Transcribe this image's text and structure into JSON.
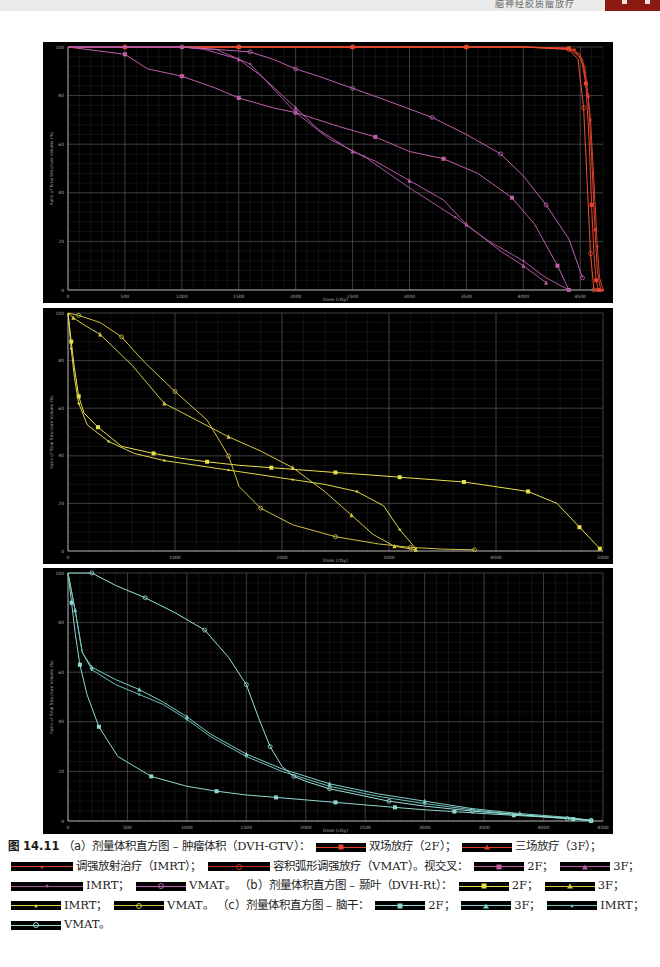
{
  "page": {
    "header_text": "脑神经胶质瘤放疗",
    "header_tab_color": "#8a1a12"
  },
  "chart_data": [
    {
      "id": "a",
      "type": "line",
      "title": "DVH-GTV",
      "xlabel": "Dose (cGy)",
      "ylabel": "Ratio of Total Structure Volume (%)",
      "xlim": [
        0,
        4700
      ],
      "ylim": [
        0,
        100
      ],
      "xticks": [
        0,
        500,
        1000,
        1500,
        2000,
        2500,
        3000,
        3500,
        4000,
        4500
      ],
      "yticks": [
        0,
        20,
        40,
        60,
        80,
        100
      ],
      "grid": true,
      "legend_position": "caption",
      "series": [
        {
          "name": "GTV 2F",
          "color": "#e8452a",
          "marker": "square",
          "x": [
            0,
            500,
            1000,
            1500,
            2000,
            2500,
            3000,
            3500,
            4000,
            4400,
            4500,
            4550,
            4580,
            4600,
            4620,
            4640,
            4660
          ],
          "y": [
            100,
            100,
            100,
            100,
            100,
            100,
            100,
            100,
            100,
            99.5,
            97,
            85,
            60,
            35,
            15,
            4,
            0
          ]
        },
        {
          "name": "GTV 3F",
          "color": "#e0402a",
          "marker": "triangle",
          "x": [
            0,
            500,
            1000,
            1500,
            2000,
            2500,
            3000,
            3500,
            4000,
            4400,
            4520,
            4570,
            4600,
            4630,
            4650,
            4680
          ],
          "y": [
            100,
            100,
            100,
            100,
            100,
            100,
            100,
            100,
            100,
            99.5,
            95,
            80,
            55,
            25,
            8,
            0
          ]
        },
        {
          "name": "GTV IMRT",
          "color": "#d8402a",
          "marker": "dot",
          "x": [
            0,
            500,
            1000,
            1500,
            2000,
            2500,
            3000,
            3500,
            4000,
            4450,
            4540,
            4590,
            4620,
            4650,
            4670,
            4700
          ],
          "y": [
            100,
            100,
            100,
            100,
            100,
            100,
            100,
            100,
            100,
            99,
            92,
            70,
            45,
            18,
            5,
            0
          ]
        },
        {
          "name": "GTV VMAT",
          "color": "#ee5030",
          "marker": "circle",
          "x": [
            0,
            500,
            1000,
            1500,
            2000,
            2500,
            3000,
            3500,
            4000,
            4400,
            4480,
            4530,
            4560,
            4590,
            4620
          ],
          "y": [
            100,
            100,
            100,
            100,
            100,
            100,
            100,
            100,
            100,
            99,
            95,
            75,
            45,
            15,
            0
          ]
        },
        {
          "name": "Chiasm 2F",
          "color": "#c05fa8",
          "marker": "square",
          "x": [
            0,
            500,
            700,
            1000,
            1300,
            1500,
            1800,
            2000,
            2400,
            2700,
            3000,
            3300,
            3600,
            3900,
            4100,
            4300,
            4400
          ],
          "y": [
            100,
            97,
            91,
            88,
            83,
            79,
            75,
            73,
            67,
            63,
            57,
            54,
            48,
            38,
            27,
            10,
            0
          ]
        },
        {
          "name": "Chiasm 3F",
          "color": "#b85aa8",
          "marker": "triangle",
          "x": [
            0,
            1000,
            1200,
            1500,
            1700,
            2000,
            2200,
            2500,
            2700,
            3000,
            3300,
            3500,
            3800,
            4000,
            4200
          ],
          "y": [
            100,
            100,
            99,
            95,
            88,
            75,
            66,
            57,
            53,
            45,
            37,
            27,
            16,
            10,
            3
          ]
        },
        {
          "name": "Chiasm IMRT",
          "color": "#a855a0",
          "marker": "dot",
          "x": [
            0,
            1000,
            1300,
            1600,
            1800,
            2000,
            2300,
            2600,
            3000,
            3400,
            3700,
            4000,
            4200,
            4400
          ],
          "y": [
            100,
            100,
            99,
            93,
            83,
            73,
            62,
            55,
            42,
            30,
            20,
            12,
            5,
            0
          ]
        },
        {
          "name": "Chiasm VMAT",
          "color": "#c060b0",
          "marker": "circle",
          "x": [
            0,
            1000,
            1300,
            1600,
            1800,
            2000,
            2200,
            2500,
            2800,
            3200,
            3500,
            3800,
            4000,
            4200,
            4400,
            4520
          ],
          "y": [
            100,
            100,
            99,
            98,
            95,
            91,
            88,
            83,
            78,
            71,
            64,
            56,
            47,
            35,
            21,
            5
          ]
        }
      ]
    },
    {
      "id": "b",
      "type": "line",
      "title": "DVH-Rt",
      "xlabel": "Dose (cGy)",
      "ylabel": "Ratio of Total Structure Volume (%)",
      "xlim": [
        0,
        5000
      ],
      "ylim": [
        0,
        100
      ],
      "xticks": [
        0,
        1000,
        2000,
        3000,
        4000,
        5000
      ],
      "yticks": [
        0,
        20,
        40,
        60,
        80,
        100
      ],
      "grid": true,
      "legend_position": "caption",
      "series": [
        {
          "name": "Rt 2F",
          "color": "#e8e04a",
          "marker": "square",
          "x": [
            0,
            30,
            60,
            100,
            150,
            280,
            500,
            800,
            1050,
            1300,
            1600,
            1900,
            2200,
            2500,
            2800,
            3100,
            3400,
            3700,
            4000,
            4300,
            4570,
            4780,
            4970
          ],
          "y": [
            100,
            88,
            77,
            65,
            58,
            52,
            44,
            41,
            39,
            37.5,
            36,
            35,
            34,
            33,
            32,
            31,
            30,
            29,
            27,
            25,
            20,
            10,
            1
          ]
        },
        {
          "name": "Rt 3F",
          "color": "#d8c840",
          "marker": "triangle",
          "x": [
            0,
            50,
            150,
            300,
            600,
            900,
            1200,
            1500,
            1800,
            2100,
            2400,
            2650,
            2850,
            3050,
            3250
          ],
          "y": [
            100,
            98,
            95,
            91,
            78,
            62,
            55,
            48,
            42,
            35,
            25,
            15,
            7,
            2,
            0.5
          ]
        },
        {
          "name": "Rt IMRT",
          "color": "#e0d848",
          "marker": "dot",
          "x": [
            0,
            30,
            60,
            100,
            180,
            380,
            620,
            900,
            1200,
            1500,
            1800,
            2100,
            2400,
            2700,
            2950,
            3100,
            3250
          ],
          "y": [
            100,
            85,
            73,
            62,
            53,
            46,
            41,
            38,
            36,
            34,
            32,
            30,
            28,
            25,
            19,
            9,
            1
          ]
        },
        {
          "name": "Rt VMAT",
          "color": "#d0c040",
          "marker": "circle",
          "x": [
            0,
            100,
            300,
            500,
            700,
            1000,
            1300,
            1500,
            1600,
            1800,
            2100,
            2500,
            2900,
            3200,
            3500,
            3800
          ],
          "y": [
            100,
            99,
            96,
            90,
            80,
            67,
            55,
            40,
            27,
            18,
            11,
            6,
            3,
            1.5,
            0.8,
            0.5
          ]
        }
      ]
    },
    {
      "id": "c",
      "type": "line",
      "title": "DVH-Brainstem",
      "xlabel": "Dose (cGy)",
      "ylabel": "Ratio of Total Structure Volume (%)",
      "xlim": [
        0,
        4500
      ],
      "ylim": [
        0,
        100
      ],
      "xticks": [
        0,
        500,
        1000,
        1500,
        2000,
        2500,
        3000,
        3500,
        4000,
        4500
      ],
      "yticks": [
        0,
        20,
        40,
        60,
        80,
        100
      ],
      "grid": true,
      "legend_position": "caption",
      "series": [
        {
          "name": "Brainstem 2F",
          "color": "#8ed8d0",
          "marker": "square",
          "x": [
            0,
            30,
            60,
            100,
            160,
            260,
            420,
            700,
            1000,
            1250,
            1500,
            1750,
            2000,
            2250,
            2500,
            2750,
            3000,
            3250,
            3500,
            3750,
            4000,
            4250,
            4400
          ],
          "y": [
            100,
            88,
            76,
            63,
            51,
            38,
            26,
            18,
            14,
            12,
            10.5,
            9.5,
            8.5,
            7.5,
            6.5,
            5.5,
            4.5,
            3.8,
            3,
            2.3,
            1.6,
            0.8,
            0
          ]
        },
        {
          "name": "Brainstem 3F",
          "color": "#7fcfc8",
          "marker": "triangle",
          "x": [
            0,
            60,
            120,
            200,
            400,
            600,
            800,
            1000,
            1200,
            1500,
            1800,
            2200,
            2600,
            3000,
            3400,
            3800,
            4200,
            4400
          ],
          "y": [
            100,
            85,
            68,
            62,
            57,
            53,
            48,
            42,
            35,
            27,
            21,
            15,
            11,
            8,
            5,
            3,
            1.5,
            0.3
          ]
        },
        {
          "name": "Brainstem IMRT",
          "color": "#6ec0b8",
          "marker": "dot",
          "x": [
            0,
            60,
            120,
            200,
            400,
            600,
            800,
            1000,
            1200,
            1500,
            1800,
            2200,
            2600,
            3000,
            3400,
            3800,
            4200,
            4400
          ],
          "y": [
            100,
            85,
            68,
            61,
            55,
            51,
            47,
            41,
            34,
            26,
            20,
            14,
            10,
            7,
            4.5,
            2.5,
            1.2,
            0.3
          ]
        },
        {
          "name": "Brainstem VMAT",
          "color": "#9be0d8",
          "marker": "circle",
          "x": [
            0,
            200,
            400,
            650,
            900,
            1150,
            1350,
            1500,
            1600,
            1700,
            1800,
            1900,
            2000,
            2200,
            2400,
            2700,
            3000,
            3400,
            3800,
            4200,
            4400
          ],
          "y": [
            100,
            100,
            95,
            90,
            84,
            77,
            66,
            55,
            42,
            30,
            22,
            18,
            16,
            13,
            11,
            8,
            6,
            4,
            2.5,
            1,
            0.3
          ]
        }
      ]
    }
  ],
  "caption": {
    "figure_no": "图 14.11",
    "a_label": "（a）",
    "a_title": "剂量体积直方图 – 肿瘤体积（DVH-GTV）：",
    "a_2f": "双场放疗（2F）；",
    "a_3f": "三场放疗（3F）；",
    "a_imrt": "调强放射治疗（IMRT）；",
    "a_vmat": "容积弧形调强放疗（VMAT）。",
    "a_chiasm": "视交叉：",
    "a_chiasm_2f": "2F；",
    "a_chiasm_3f": "3F；",
    "a_chiasm_imrt": "IMRT；",
    "a_chiasm_vmat": "VMAT。",
    "b_label": "（b）",
    "b_title": "剂量体积直方图 – 颞叶（DVH-Rt）：",
    "b_2f": "2F；",
    "b_3f": "3F；",
    "b_imrt": "IMRT；",
    "b_vmat": "VMAT。",
    "c_label": "（c）",
    "c_title": "剂量体积直方图 – 脑干：",
    "c_2f": "2F；",
    "c_3f": "3F；",
    "c_imrt": "IMRT；",
    "c_vmat": "VMAT。"
  },
  "legend_swatches": {
    "gtv_2f": {
      "color": "#e8452a",
      "marker": "square"
    },
    "gtv_3f": {
      "color": "#d8402a",
      "marker": "triangle"
    },
    "gtv_imrt": {
      "color": "#d8402a",
      "marker": "dot"
    },
    "gtv_vmat": {
      "color": "#c03020",
      "marker": "circle"
    },
    "chiasm_2f": {
      "color": "#c05fa8",
      "marker": "square"
    },
    "chiasm_3f": {
      "color": "#b85aa8",
      "marker": "triangle"
    },
    "chiasm_imrt": {
      "color": "#a855a0",
      "marker": "dot"
    },
    "chiasm_vmat": {
      "color": "#c060b0",
      "marker": "circle"
    },
    "rt_2f": {
      "color": "#e8e04a",
      "marker": "square"
    },
    "rt_3f": {
      "color": "#d8c840",
      "marker": "triangle"
    },
    "rt_imrt": {
      "color": "#e0d848",
      "marker": "dot"
    },
    "rt_vmat": {
      "color": "#d0c040",
      "marker": "circle"
    },
    "bs_2f": {
      "color": "#8ed8d0",
      "marker": "square"
    },
    "bs_3f": {
      "color": "#7fcfc8",
      "marker": "triangle"
    },
    "bs_imrt": {
      "color": "#6ec0b8",
      "marker": "dot"
    },
    "bs_vmat": {
      "color": "#9be0d8",
      "marker": "circle"
    }
  }
}
